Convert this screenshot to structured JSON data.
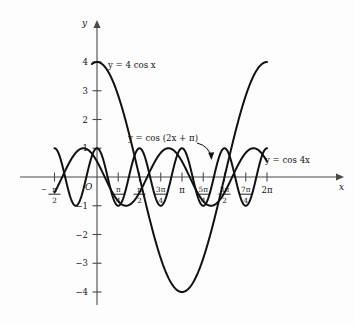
{
  "figure": {
    "name": "trigonometric-cosine-graphs",
    "background_color": "#fdfdfd",
    "curve_color": "#111111",
    "axis_color": "#4a4a4a",
    "origin_label": "O",
    "x_axis_name": "x",
    "y_axis_name": "y"
  },
  "labels": {
    "curve1": "y = 4 cos x",
    "curve2": "y = cos (2x + π)",
    "curve3": "y = cos 4x"
  },
  "y_ticks": [
    {
      "value": 4,
      "label": "4"
    },
    {
      "value": 3,
      "label": "3"
    },
    {
      "value": 2,
      "label": "2"
    },
    {
      "value": 1,
      "label": "1"
    },
    {
      "value": -1,
      "label": "−1"
    },
    {
      "value": -2,
      "label": "−2"
    },
    {
      "value": -3,
      "label": "−3"
    },
    {
      "value": -4,
      "label": "−4"
    }
  ],
  "x_ticks": [
    {
      "value": -0.5,
      "label": "−π/2",
      "num": "π",
      "den": "2",
      "sign": "−"
    },
    {
      "value": 0.25,
      "label": "π/4",
      "num": "π",
      "den": "4",
      "sign": ""
    },
    {
      "value": 0.5,
      "label": "π/2",
      "num": "π",
      "den": "2",
      "sign": ""
    },
    {
      "value": 0.75,
      "label": "3π/4",
      "num": "3π",
      "den": "4",
      "sign": ""
    },
    {
      "value": 1.0,
      "label": "π",
      "num": "π",
      "den": "",
      "sign": ""
    },
    {
      "value": 1.25,
      "label": "5π/4",
      "num": "5π",
      "den": "4",
      "sign": ""
    },
    {
      "value": 1.5,
      "label": "3π/2",
      "num": "3π",
      "den": "2",
      "sign": ""
    },
    {
      "value": 1.75,
      "label": "7π/4",
      "num": "7π",
      "den": "4",
      "sign": ""
    },
    {
      "value": 2.0,
      "label": "2π",
      "num": "2π",
      "den": "",
      "sign": ""
    }
  ],
  "chart_data": {
    "type": "line",
    "title": "",
    "xlabel": "x",
    "ylabel": "y",
    "xlim": [
      -0.5,
      2.0
    ],
    "ylim": [
      -4.5,
      4.5
    ],
    "x_unit": "pi",
    "grid": false,
    "legend_position": "inline-annotations",
    "series": [
      {
        "name": "y = 4 cos x",
        "amplitude": 4,
        "period_pi": 2,
        "phase_pi": 0,
        "formula": "4*cos(pi*t)",
        "domain_pi": [
          -0.06,
          2.0
        ],
        "key_points": [
          {
            "x_pi": 0,
            "y": 4
          },
          {
            "x_pi": 0.5,
            "y": 0
          },
          {
            "x_pi": 1.0,
            "y": -4
          },
          {
            "x_pi": 1.5,
            "y": 0
          },
          {
            "x_pi": 2.0,
            "y": 4
          }
        ]
      },
      {
        "name": "y = cos (2x + π)",
        "amplitude": 1,
        "period_pi": 1,
        "phase_pi": 1,
        "formula": "cos(2*pi*t + pi)",
        "domain_pi": [
          -0.5,
          2.0
        ],
        "key_points": [
          {
            "x_pi": 0,
            "y": -1
          },
          {
            "x_pi": 0.5,
            "y": 1
          },
          {
            "x_pi": 1.0,
            "y": -1
          },
          {
            "x_pi": 1.5,
            "y": 1
          },
          {
            "x_pi": 2.0,
            "y": -1
          }
        ]
      },
      {
        "name": "y = cos 4x",
        "amplitude": 1,
        "period_pi": 0.5,
        "phase_pi": 0,
        "formula": "cos(4*pi*t)",
        "domain_pi": [
          -0.5,
          2.0
        ],
        "key_points": [
          {
            "x_pi": -0.5,
            "y": 1
          },
          {
            "x_pi": -0.25,
            "y": -1
          },
          {
            "x_pi": 0,
            "y": 1
          },
          {
            "x_pi": 0.25,
            "y": -1
          },
          {
            "x_pi": 0.5,
            "y": 1
          },
          {
            "x_pi": 1.0,
            "y": 1
          },
          {
            "x_pi": 1.5,
            "y": 1
          },
          {
            "x_pi": 2.0,
            "y": 1
          }
        ]
      }
    ]
  }
}
